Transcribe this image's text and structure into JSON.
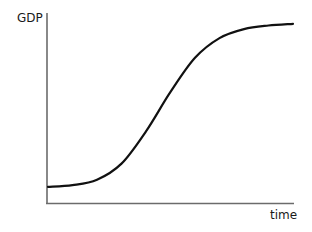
{
  "chart_data": {
    "type": "line",
    "title": "",
    "xlabel": "time",
    "ylabel": "GDP",
    "grid": false,
    "legend": null,
    "x": [
      0,
      0.1,
      0.2,
      0.3,
      0.4,
      0.5,
      0.6,
      0.7,
      0.8,
      0.9,
      1.0
    ],
    "series": [
      {
        "name": "GDP",
        "values": [
          0.09,
          0.1,
          0.13,
          0.22,
          0.4,
          0.62,
          0.81,
          0.92,
          0.97,
          0.99,
          1.0
        ]
      }
    ],
    "xlim": [
      0,
      1
    ],
    "ylim": [
      0,
      1.06
    ],
    "tick_labels": false
  },
  "labels": {
    "y_axis": "GDP",
    "x_axis": "time"
  },
  "colors": {
    "axis": "#6b6b6b",
    "curve": "#111111",
    "text": "#1a1a1a"
  }
}
